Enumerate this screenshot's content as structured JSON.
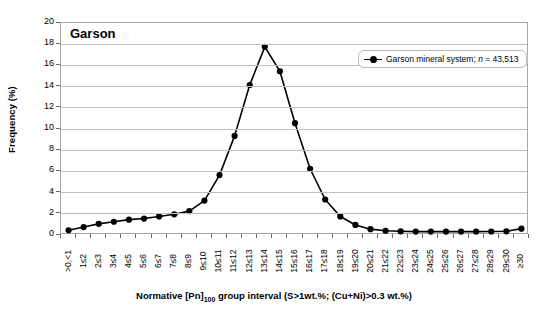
{
  "panel": {
    "title": "Garson"
  },
  "legend": {
    "entries": [
      {
        "label_prefix": "Garson mineral system; ",
        "italic": "n",
        "label_suffix": " = 43,513",
        "marker": "line-circle-marker",
        "color": "#000000"
      }
    ]
  },
  "axes": {
    "y_title": "Frequency (%)",
    "x_title_parts": {
      "before": "Normative [Pn]",
      "sub": "100",
      "after": " group interval (S>1wt.%; (Cu+Ni)>0.3 wt.%)"
    },
    "x_title_plain": "Normative [Pn]100 group interval (S>1wt.%; (Cu+Ni)>0.3 wt.%)"
  },
  "chart_data": {
    "type": "line",
    "title": "Garson",
    "xlabel": "Normative [Pn]100 group interval (S>1wt.%; (Cu+Ni)>0.3 wt.%)",
    "ylabel": "Frequency (%)",
    "ylim": [
      0,
      20
    ],
    "ytick_step": 2,
    "yticks": [
      0,
      2,
      4,
      6,
      8,
      10,
      12,
      14,
      16,
      18,
      20
    ],
    "grid": "horizontal",
    "legend_position": "top-right-inside",
    "categories": [
      ">0,<1",
      "1≤2",
      "2≤3",
      "3≤4",
      "4≤5",
      "5≤6",
      "6≤7",
      "7≤8",
      "8≤9",
      "9≤10",
      "10≤11",
      "11≤12",
      "12≤13",
      "13≤14",
      "14≤15",
      "15≤16",
      "16≤17",
      "17≤18",
      "18≤19",
      "19≤20",
      "20≤21",
      "21≤22",
      "22≤23",
      "23≤24",
      "24≤25",
      "25≤26",
      "26≤27",
      "27≤28",
      "28≤29",
      "29≤30",
      "≥30"
    ],
    "series": [
      {
        "name": "Garson mineral system; n = 43,513",
        "n": 43513,
        "marker": "circle",
        "color": "#000000",
        "values": [
          0.45,
          0.75,
          1.05,
          1.25,
          1.45,
          1.55,
          1.75,
          1.95,
          2.25,
          3.25,
          5.65,
          9.35,
          14.15,
          17.75,
          15.45,
          10.55,
          6.25,
          3.35,
          1.75,
          0.95,
          0.55,
          0.4,
          0.35,
          0.32,
          0.32,
          0.32,
          0.32,
          0.32,
          0.33,
          0.35,
          0.6
        ]
      }
    ]
  }
}
